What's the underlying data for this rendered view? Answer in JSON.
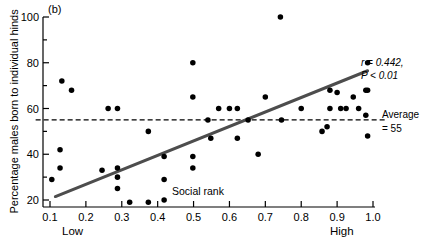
{
  "figure": {
    "panel_label": "(b)",
    "background": "#ffffff",
    "foreground": "#000000"
  },
  "annotations": {
    "stat_r": "r = 0.442,",
    "stat_p": "P < 0.01",
    "average_line1": "Average",
    "average_line2": "= 55",
    "social_rank": "Social rank",
    "low": "Low",
    "high": "High"
  },
  "chart_data": {
    "type": "scatter",
    "title": "(b)",
    "xlabel": "Social rank",
    "ylabel": "Percentage males born to individual hinds",
    "xlim": [
      0.05,
      1.04
    ],
    "ylim": [
      17,
      102
    ],
    "xticks": [
      0.1,
      0.2,
      0.3,
      0.4,
      0.5,
      0.6,
      0.7,
      0.8,
      0.9,
      1.0
    ],
    "xticklabels": [
      "0.1",
      "0.2",
      "0.3",
      "0.4",
      "0.5",
      "0.6",
      "0.7",
      "0.8",
      "0.9",
      "1.0"
    ],
    "yticks": [
      20,
      30,
      40,
      50,
      60,
      70,
      80,
      90,
      100
    ],
    "yticklabels": [
      "20",
      "",
      "40",
      "",
      "60",
      "",
      "80",
      "",
      "100"
    ],
    "x_axis_low_label": "Low",
    "x_axis_high_label": "High",
    "grid": false,
    "legend": false,
    "marker_color": "#000000",
    "marker_size": 4,
    "points": [
      {
        "x": 0.105,
        "y": 29
      },
      {
        "x": 0.128,
        "y": 42
      },
      {
        "x": 0.128,
        "y": 34
      },
      {
        "x": 0.133,
        "y": 72
      },
      {
        "x": 0.16,
        "y": 68
      },
      {
        "x": 0.245,
        "y": 33
      },
      {
        "x": 0.262,
        "y": 60
      },
      {
        "x": 0.288,
        "y": 60
      },
      {
        "x": 0.288,
        "y": 34
      },
      {
        "x": 0.288,
        "y": 30
      },
      {
        "x": 0.288,
        "y": 25
      },
      {
        "x": 0.322,
        "y": 19
      },
      {
        "x": 0.374,
        "y": 50
      },
      {
        "x": 0.374,
        "y": 19
      },
      {
        "x": 0.418,
        "y": 39
      },
      {
        "x": 0.418,
        "y": 29
      },
      {
        "x": 0.418,
        "y": 20
      },
      {
        "x": 0.498,
        "y": 39
      },
      {
        "x": 0.498,
        "y": 34
      },
      {
        "x": 0.498,
        "y": 65
      },
      {
        "x": 0.498,
        "y": 80
      },
      {
        "x": 0.54,
        "y": 55
      },
      {
        "x": 0.548,
        "y": 47
      },
      {
        "x": 0.57,
        "y": 60
      },
      {
        "x": 0.6,
        "y": 60
      },
      {
        "x": 0.622,
        "y": 60
      },
      {
        "x": 0.622,
        "y": 47
      },
      {
        "x": 0.652,
        "y": 55
      },
      {
        "x": 0.68,
        "y": 40
      },
      {
        "x": 0.7,
        "y": 65
      },
      {
        "x": 0.742,
        "y": 100
      },
      {
        "x": 0.745,
        "y": 55
      },
      {
        "x": 0.8,
        "y": 60
      },
      {
        "x": 0.858,
        "y": 50
      },
      {
        "x": 0.872,
        "y": 52
      },
      {
        "x": 0.88,
        "y": 68
      },
      {
        "x": 0.88,
        "y": 60
      },
      {
        "x": 0.9,
        "y": 67
      },
      {
        "x": 0.91,
        "y": 60
      },
      {
        "x": 0.925,
        "y": 60
      },
      {
        "x": 0.945,
        "y": 65
      },
      {
        "x": 0.98,
        "y": 68
      },
      {
        "x": 0.985,
        "y": 68
      },
      {
        "x": 0.98,
        "y": 57
      },
      {
        "x": 0.985,
        "y": 80
      },
      {
        "x": 0.985,
        "y": 48
      },
      {
        "x": 0.96,
        "y": 60
      }
    ],
    "trend_line": {
      "label": "regression line",
      "color": "#4d4d4d",
      "width": 3,
      "x1": 0.115,
      "y1": 21.5,
      "x2": 0.985,
      "y2": 76.5
    },
    "average_line": {
      "label": "Average = 55",
      "value": 55,
      "style": "dashed",
      "color": "#000000",
      "x1": 0.06,
      "x2": 1.04
    },
    "statistics": {
      "r": 0.442,
      "p": "< 0.01"
    }
  }
}
